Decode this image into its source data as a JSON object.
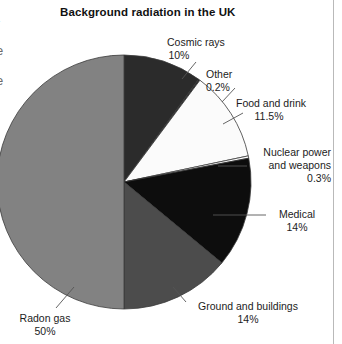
{
  "page": {
    "edge_fragments": [
      "-",
      "e",
      "e"
    ],
    "column_rule_color": "#b9b9b9",
    "background_color": "#ffffff"
  },
  "chart_data": {
    "type": "pie",
    "title": "Background radiation in the UK",
    "subtitle": "",
    "xlabel": "",
    "ylabel": "",
    "legend_position": "callout-labels",
    "grid": false,
    "total_percent": 100,
    "start_angle_deg": 0,
    "direction": "clockwise",
    "categories": [
      "Cosmic rays",
      "Other",
      "Food and drink",
      "Nuclear power and weapons",
      "Medical",
      "Ground and buildings",
      "Radon gas"
    ],
    "values": [
      10,
      0.2,
      11.5,
      0.3,
      14,
      14,
      50
    ],
    "slices": [
      {
        "label": "Cosmic rays",
        "label_line1": "Cosmic rays",
        "value": 10,
        "percent_text": "10%",
        "color": "#2b2b2b"
      },
      {
        "label": "Other",
        "label_line1": "Other",
        "value": 0.2,
        "percent_text": "0.2%",
        "color": "#2b2b2b"
      },
      {
        "label": "Food and drink",
        "label_line1": "Food and drink",
        "value": 11.5,
        "percent_text": "11.5%",
        "color": "#fbfbfb"
      },
      {
        "label": "Nuclear power and weapons",
        "label_line1": "Nuclear power",
        "label_line2": "and weapons",
        "value": 0.3,
        "percent_text": "0.3%",
        "color": "#fbfbfb"
      },
      {
        "label": "Medical",
        "label_line1": "Medical",
        "value": 14,
        "percent_text": "14%",
        "color": "#0d0d0d"
      },
      {
        "label": "Ground and buildings",
        "label_line1": "Ground and buildings",
        "value": 14,
        "percent_text": "14%",
        "color": "#4c4c4c"
      },
      {
        "label": "Radon gas",
        "label_line1": "Radon gas",
        "value": 50,
        "percent_text": "50%",
        "color": "#828282"
      }
    ]
  }
}
